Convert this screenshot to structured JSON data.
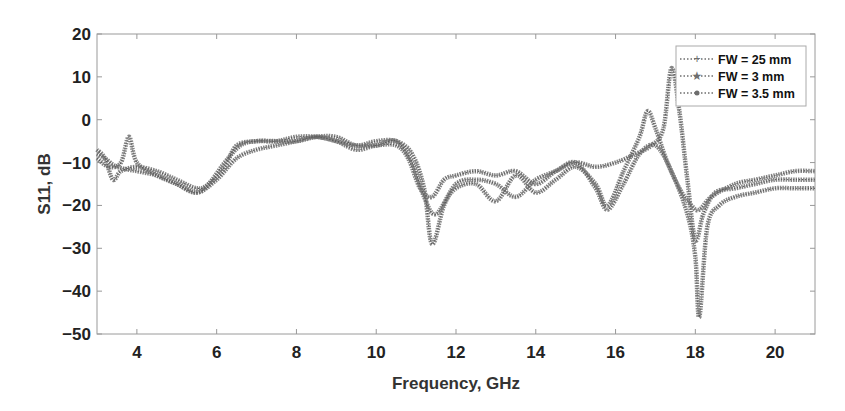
{
  "chart_data": {
    "type": "line",
    "title": "",
    "xlabel": "Frequency, GHz",
    "ylabel": "S11, dB",
    "xlim": [
      3,
      21
    ],
    "ylim": [
      -50,
      20
    ],
    "xticks": [
      4,
      6,
      8,
      10,
      12,
      14,
      16,
      18,
      20
    ],
    "yticks": [
      20,
      10,
      0,
      -10,
      -20,
      -30,
      -40,
      -50
    ],
    "ytick_labels": [
      "20",
      "10",
      "0",
      "−10",
      "−20",
      "−30",
      "−40",
      "−50"
    ],
    "grid": false,
    "legend_position": "upper right",
    "series": [
      {
        "name": "FW = 25 mm",
        "marker": "plus",
        "x": [
          3.0,
          3.2,
          3.5,
          4.0,
          4.5,
          5.0,
          5.5,
          5.8,
          6.2,
          6.6,
          7.0,
          7.5,
          8.0,
          8.5,
          9.0,
          9.5,
          10.0,
          10.5,
          10.8,
          11.1,
          11.4,
          11.7,
          12.0,
          12.5,
          13.0,
          13.5,
          14.0,
          14.5,
          15.0,
          15.5,
          16.0,
          16.5,
          16.9,
          17.2,
          17.4,
          17.6,
          17.8,
          18.0,
          18.2,
          18.5,
          19.0,
          19.5,
          20.0,
          20.5,
          21.0
        ],
        "y": [
          -8,
          -9,
          -11,
          -12,
          -13,
          -15,
          -17,
          -15,
          -10,
          -6,
          -5,
          -5,
          -4,
          -4,
          -5,
          -7,
          -6,
          -6,
          -9,
          -16,
          -18,
          -14,
          -13,
          -12,
          -13,
          -12,
          -15,
          -12,
          -10,
          -11,
          -10,
          -8,
          -6,
          -2,
          12,
          2,
          -14,
          -28,
          -22,
          -17,
          -16,
          -15,
          -14,
          -14,
          -14
        ]
      },
      {
        "name": "FW = 3 mm",
        "marker": "star",
        "x": [
          3.0,
          3.2,
          3.4,
          3.6,
          4.0,
          4.5,
          5.0,
          5.5,
          5.8,
          6.2,
          6.5,
          7.0,
          7.5,
          8.0,
          8.5,
          9.0,
          9.5,
          10.0,
          10.5,
          10.9,
          11.2,
          11.4,
          11.7,
          12.0,
          12.5,
          13.0,
          13.5,
          14.0,
          14.5,
          15.0,
          15.5,
          15.8,
          16.2,
          16.6,
          16.8,
          17.0,
          17.3,
          17.6,
          17.9,
          18.1,
          18.4,
          19.0,
          19.5,
          20.0,
          20.5,
          21.0
        ],
        "y": [
          -7,
          -9,
          -14,
          -12,
          -11,
          -12,
          -14,
          -16,
          -15,
          -11,
          -6,
          -5,
          -5,
          -5,
          -4,
          -4,
          -6,
          -5,
          -5,
          -8,
          -16,
          -29,
          -20,
          -16,
          -15,
          -19,
          -13,
          -17,
          -14,
          -11,
          -15,
          -20,
          -12,
          -4,
          2,
          -2,
          -10,
          -16,
          -20,
          -21,
          -18,
          -15,
          -14,
          -13,
          -12,
          -12
        ]
      },
      {
        "name": "FW = 3.5 mm",
        "marker": "circle",
        "x": [
          3.0,
          3.3,
          3.6,
          3.8,
          4.0,
          4.5,
          5.0,
          5.5,
          6.0,
          6.5,
          7.0,
          7.5,
          8.0,
          8.5,
          9.0,
          9.5,
          10.0,
          10.5,
          10.9,
          11.2,
          11.5,
          12.0,
          12.5,
          13.0,
          13.5,
          14.0,
          14.5,
          15.0,
          15.5,
          15.8,
          16.2,
          16.6,
          17.0,
          17.4,
          17.8,
          18.0,
          18.1,
          18.3,
          18.6,
          19.0,
          19.5,
          20.0,
          20.5,
          21.0
        ],
        "y": [
          -9,
          -11,
          -10,
          -4,
          -10,
          -13,
          -15,
          -17,
          -14,
          -9,
          -7,
          -6,
          -5,
          -4,
          -5,
          -6,
          -6,
          -5,
          -10,
          -18,
          -22,
          -15,
          -14,
          -15,
          -18,
          -14,
          -12,
          -10,
          -16,
          -21,
          -15,
          -8,
          -6,
          -12,
          -22,
          -32,
          -46,
          -25,
          -20,
          -18,
          -17,
          -16,
          -16,
          -16
        ]
      }
    ]
  },
  "legend": {
    "items": [
      "FW = 25 mm",
      "FW = 3 mm",
      "FW = 3.5 mm"
    ]
  },
  "axes": {
    "xlabel": "Frequency, GHz",
    "ylabel": "S11, dB",
    "xtick_labels": [
      "4",
      "6",
      "8",
      "10",
      "12",
      "14",
      "16",
      "18",
      "20"
    ],
    "ytick_labels": [
      "20",
      "10",
      "0",
      "−10",
      "−20",
      "−30",
      "−40",
      "−50"
    ]
  },
  "style": {
    "line_color": "#6e6e6e",
    "axis_color": "#999999",
    "text_color": "#222222"
  }
}
